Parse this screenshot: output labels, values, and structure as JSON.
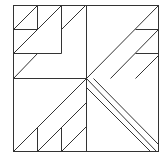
{
  "diagram": {
    "type": "quilt-block-line-drawing",
    "stroke_color": "#333333",
    "background": "#ffffff",
    "frame": {
      "x": 13,
      "y": 5,
      "w": 145,
      "h": 146
    },
    "lines": [
      {
        "id": "mid-vertical",
        "x1": 86,
        "y1": 5,
        "x2": 86,
        "y2": 151
      },
      {
        "id": "mid-horizontal-left",
        "x1": 13,
        "y1": 78,
        "x2": 86,
        "y2": 78
      },
      {
        "id": "tl-small-box-right",
        "x1": 37,
        "y1": 5,
        "x2": 37,
        "y2": 29
      },
      {
        "id": "tl-small-box-bottom",
        "x1": 13,
        "y1": 29,
        "x2": 37,
        "y2": 29
      },
      {
        "id": "tl-small-box-diag",
        "x1": 13,
        "y1": 29,
        "x2": 37,
        "y2": 5
      },
      {
        "id": "tl-vertical-61",
        "x1": 61,
        "y1": 5,
        "x2": 61,
        "y2": 53
      },
      {
        "id": "tl-horizontal-53",
        "x1": 13,
        "y1": 53,
        "x2": 61,
        "y2": 53
      },
      {
        "id": "tl-long-diag",
        "x1": 13,
        "y1": 53,
        "x2": 61,
        "y2": 5
      },
      {
        "id": "tl-lower-diag",
        "x1": 13,
        "y1": 78,
        "x2": 37,
        "y2": 53
      },
      {
        "id": "tl-right-diag",
        "x1": 61,
        "y1": 29,
        "x2": 85,
        "y2": 5
      },
      {
        "id": "tr-main-diag",
        "x1": 86,
        "y1": 78,
        "x2": 158,
        "y2": 5
      },
      {
        "id": "tr-horizontal-29",
        "x1": 135,
        "y1": 29,
        "x2": 158,
        "y2": 29
      },
      {
        "id": "tr-horizontal-53",
        "x1": 135,
        "y1": 53,
        "x2": 158,
        "y2": 53
      },
      {
        "id": "tr-diag-2",
        "x1": 110,
        "y1": 78,
        "x2": 158,
        "y2": 29
      },
      {
        "id": "tr-diag-3",
        "x1": 135,
        "y1": 78,
        "x2": 158,
        "y2": 55
      },
      {
        "id": "bl-main-diag",
        "x1": 13,
        "y1": 151,
        "x2": 86,
        "y2": 78
      },
      {
        "id": "bl-diag-2",
        "x1": 37,
        "y1": 151,
        "x2": 86,
        "y2": 102
      },
      {
        "id": "bl-diag-3",
        "x1": 61,
        "y1": 151,
        "x2": 86,
        "y2": 126
      },
      {
        "id": "bl-vertical-37",
        "x1": 37,
        "y1": 127,
        "x2": 37,
        "y2": 151
      },
      {
        "id": "bl-vertical-61",
        "x1": 61,
        "y1": 127,
        "x2": 61,
        "y2": 151
      },
      {
        "id": "br-diag-1",
        "x1": 86,
        "y1": 78,
        "x2": 156,
        "y2": 151
      },
      {
        "id": "br-diag-2",
        "x1": 86,
        "y1": 87,
        "x2": 150,
        "y2": 151
      },
      {
        "id": "br-diag-2b",
        "x1": 93,
        "y1": 78,
        "x2": 158,
        "y2": 144
      }
    ]
  }
}
